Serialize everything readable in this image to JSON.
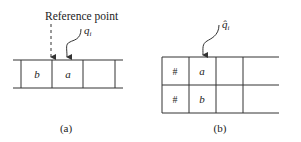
{
  "figure_a": {
    "reference_label": "Reference point",
    "pointer_label": "q",
    "pointer_subscript": "i",
    "cells": [
      "b",
      "a",
      "",
      ""
    ],
    "caption": "(a)"
  },
  "figure_b": {
    "pointer_label": "q̂",
    "pointer_subscript": "i",
    "rows": [
      [
        "#",
        "a",
        "",
        ""
      ],
      [
        "#",
        "b",
        "",
        ""
      ]
    ],
    "caption": "(b)"
  },
  "colors": {
    "line": "#333333",
    "text": "#222222",
    "background": "#ffffff"
  }
}
